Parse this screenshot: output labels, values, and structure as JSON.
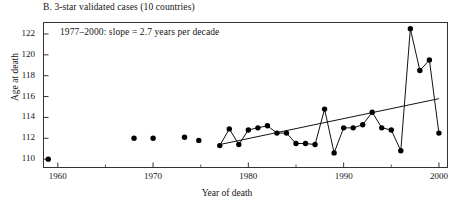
{
  "figure": {
    "panel_title": "B. 3-star validated cases (10 countries)",
    "annotation": "1977–2000: slope = 2.7 years per decade",
    "xlabel": "Year of death",
    "ylabel": "Age at death",
    "axis_color": "#333333",
    "point_color": "#000000",
    "line_color": "#111111"
  },
  "chart_data": {
    "type": "scatter",
    "title": "B. 3-star validated cases (10 countries)",
    "subtitle": "1977–2000: slope = 2.7 years per decade",
    "xlabel": "Year of death",
    "ylabel": "Age at death",
    "xlim": [
      1958.5,
      2000.9
    ],
    "ylim": [
      109.2,
      123.1
    ],
    "xticks": [
      1960,
      1970,
      1980,
      1990,
      2000
    ],
    "xticklabels": [
      "1960",
      "1970",
      "1980",
      "1990",
      "2000"
    ],
    "xminorticks": [
      1965,
      1975,
      1985,
      1995
    ],
    "yticks": [
      110,
      112,
      114,
      116,
      118,
      120,
      122
    ],
    "yticklabels": [
      "110",
      "112",
      "114",
      "116",
      "118",
      "120",
      "122"
    ],
    "grid": false,
    "legend": null,
    "series": [
      {
        "name": "Isolated early maxima (unconnected points)",
        "connected": false,
        "x": [
          1959,
          1968,
          1970,
          1973.3,
          1974.8
        ],
        "values": [
          110.0,
          112.0,
          112.0,
          112.1,
          111.8
        ]
      },
      {
        "name": "Annual maximum age at death (connected)",
        "connected": true,
        "x": [
          1977,
          1978,
          1979,
          1980,
          1981,
          1982,
          1983,
          1984,
          1985,
          1986,
          1987,
          1988,
          1989,
          1990,
          1991,
          1992,
          1993,
          1994,
          1995,
          1996,
          1997,
          1998,
          1999,
          2000
        ],
        "values": [
          111.3,
          112.9,
          111.4,
          112.8,
          113.0,
          113.2,
          112.5,
          112.5,
          111.5,
          111.5,
          111.4,
          114.8,
          110.6,
          113.0,
          113.0,
          113.3,
          114.5,
          113.0,
          112.8,
          110.8,
          122.5,
          118.5,
          119.5,
          112.5
        ]
      }
    ],
    "trend_line": {
      "name": "1977–2000 linear regression",
      "x": [
        1977,
        2000
      ],
      "values": [
        111.4,
        115.8
      ],
      "slope_per_decade": 2.7
    }
  }
}
